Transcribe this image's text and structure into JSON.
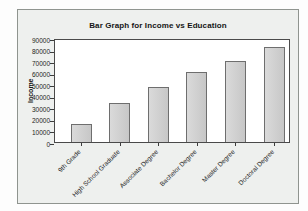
{
  "figure": {
    "page_bg": "#fdfdfd",
    "panel_bg": "#eef0ee",
    "panel_border": "#8f948f",
    "text_color": "#151515"
  },
  "chart_data": {
    "type": "bar",
    "title": "Bar Graph for Income vs Education",
    "ylabel": "Income",
    "xlabel": "",
    "categories": [
      "9th Grade",
      "High School Graduate",
      "Associate Degree",
      "Bachelor Degree",
      "Master Degree",
      "Doctoral Degree"
    ],
    "values": [
      16000,
      34000,
      48000,
      61000,
      70000,
      82000
    ],
    "ylim": [
      0,
      90000
    ],
    "yticks": [
      0,
      10000,
      20000,
      30000,
      40000,
      50000,
      60000,
      70000,
      80000,
      90000
    ],
    "grid": false,
    "legend_position": "none",
    "x_tick_rotation_deg": 45,
    "plot_bg": "#ffffff",
    "plot_border": "#4a4a4a",
    "bar_fill_light": "#dadada",
    "bar_fill_dark": "#c7c7c7",
    "bar_border": "#6e6e6e",
    "tick_color": "#3c3c3c"
  }
}
